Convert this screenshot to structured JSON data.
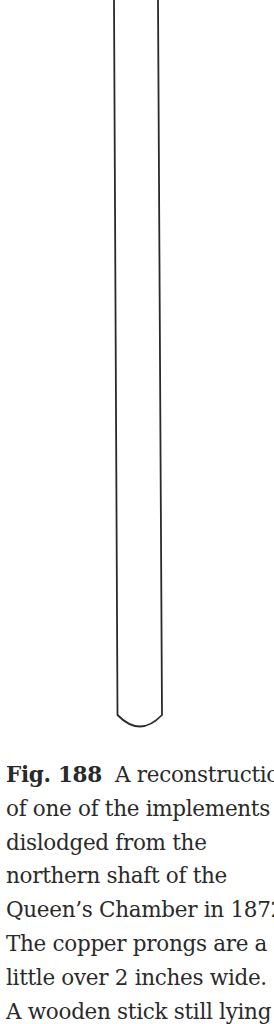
{
  "figure": {
    "stroke_color": "#2a2a2a"
  },
  "caption": {
    "label": "Fig. 188",
    "lines": [
      "A reconstruction",
      "of one of the implements",
      "dislodged from the",
      "northern shaft of the",
      "Queen’s Chamber in 1872.",
      "The copper prongs are a",
      "little over 2 inches wide.",
      "A wooden stick still lying"
    ]
  }
}
